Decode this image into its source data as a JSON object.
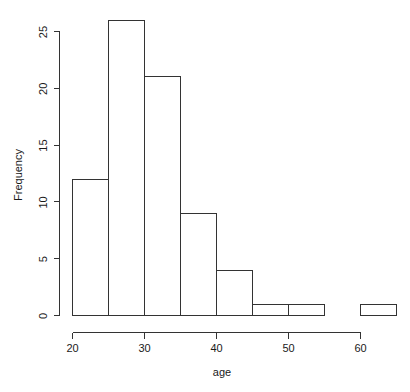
{
  "chart_data": {
    "type": "bar",
    "subtype": "histogram",
    "title": "",
    "xlabel": "age",
    "ylabel": "Frequency",
    "bin_width": 5,
    "bin_edges": [
      20,
      25,
      30,
      35,
      40,
      45,
      50,
      55,
      60,
      65
    ],
    "categories": [
      "20-25",
      "25-30",
      "30-35",
      "35-40",
      "40-45",
      "45-50",
      "50-55",
      "55-60",
      "60-65"
    ],
    "values": [
      12,
      26,
      21,
      9,
      4,
      1,
      1,
      0,
      1
    ],
    "bars": [
      {
        "label": "20-25",
        "x0": 20,
        "x1": 25,
        "value": 12
      },
      {
        "label": "25-30",
        "x0": 25,
        "x1": 30,
        "value": 26
      },
      {
        "label": "30-35",
        "x0": 30,
        "x1": 35,
        "value": 21
      },
      {
        "label": "35-40",
        "x0": 35,
        "x1": 40,
        "value": 9
      },
      {
        "label": "40-45",
        "x0": 40,
        "x1": 45,
        "value": 4
      },
      {
        "label": "45-50",
        "x0": 45,
        "x1": 50,
        "value": 1
      },
      {
        "label": "50-55",
        "x0": 50,
        "x1": 55,
        "value": 1
      },
      {
        "label": "55-60",
        "x0": 55,
        "x1": 60,
        "value": 0
      },
      {
        "label": "60-65",
        "x0": 60,
        "x1": 65,
        "value": 1
      }
    ],
    "xlim": [
      20,
      65
    ],
    "ylim": [
      0,
      26
    ],
    "xticks": [
      20,
      30,
      40,
      50,
      60
    ],
    "xtick_labels": [
      "20",
      "30",
      "40",
      "50",
      "60"
    ],
    "yticks": [
      0,
      5,
      10,
      15,
      20,
      25
    ],
    "ytick_labels": [
      "0",
      "5",
      "10",
      "15",
      "20",
      "25"
    ],
    "grid": false,
    "legend": null,
    "colors": {
      "background": "#ffffff",
      "bar_fill": "#ffffff",
      "bar_stroke": "#333333",
      "axis": "#333333",
      "text": "#1a1a1a"
    }
  },
  "labels": {
    "x_axis_title": "age",
    "y_axis_title": "Frequency"
  }
}
